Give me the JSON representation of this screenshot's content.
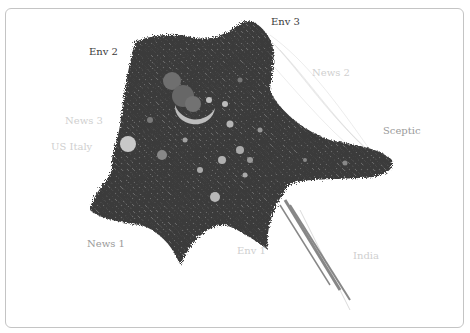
{
  "figure": {
    "type": "network-graph",
    "frame_color": "#c4c4c4",
    "node_color": "#3b3b3b",
    "highlight_node_color": "#bdbdbd",
    "labels": [
      {
        "id": "env2",
        "text": "Env 2",
        "x": 89,
        "y": 52,
        "style": "dark"
      },
      {
        "id": "env3",
        "text": "Env 3",
        "x": 271,
        "y": 22,
        "style": "dark"
      },
      {
        "id": "news2",
        "text": "News 2",
        "x": 312,
        "y": 73,
        "style": "faint"
      },
      {
        "id": "news3",
        "text": "News 3",
        "x": 65,
        "y": 121,
        "style": "faint"
      },
      {
        "id": "usitaly",
        "text": "US Italy",
        "x": 51,
        "y": 147,
        "style": "faint"
      },
      {
        "id": "sceptic",
        "text": "Sceptic",
        "x": 383,
        "y": 131,
        "style": "mid"
      },
      {
        "id": "news1",
        "text": "News 1",
        "x": 87,
        "y": 244,
        "style": "mid"
      },
      {
        "id": "env1",
        "text": "Env 1",
        "x": 237,
        "y": 251,
        "style": "faint"
      },
      {
        "id": "india",
        "text": "India",
        "x": 353,
        "y": 256,
        "style": "faint"
      }
    ]
  }
}
